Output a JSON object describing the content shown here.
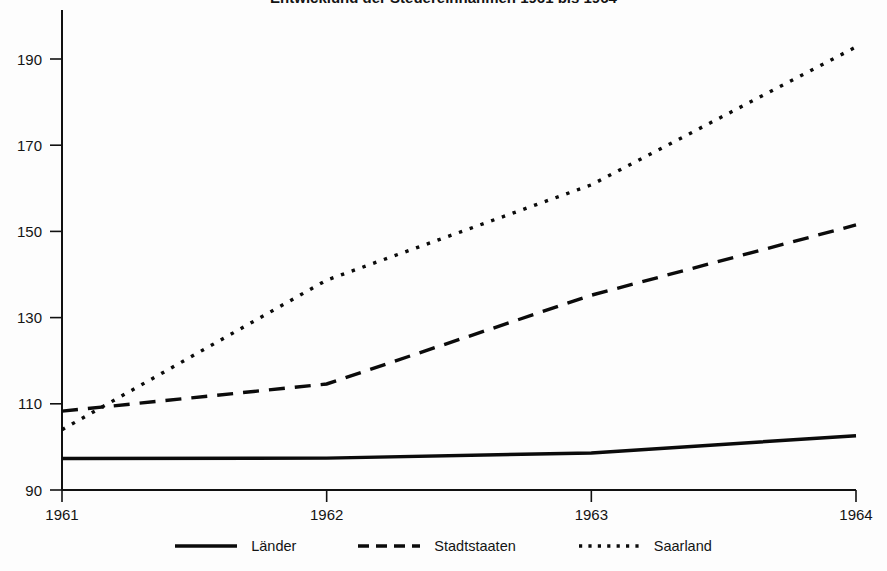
{
  "chart_data": {
    "type": "line",
    "title": "Entwicklung der Steuereinnahmen 1961 bis 1964",
    "xlabel": "",
    "ylabel": "",
    "x": [
      1961,
      1962,
      1963,
      1964
    ],
    "xticklabels": [
      "1961",
      "1962",
      "1963",
      "1964"
    ],
    "yticklabels": [
      "90",
      "110",
      "130",
      "150",
      "170",
      "190"
    ],
    "yticks": [
      90,
      110,
      130,
      150,
      170,
      190
    ],
    "xlim": [
      1961,
      1964
    ],
    "ylim": [
      90,
      197
    ],
    "grid": false,
    "legend_position": "bottom",
    "series": [
      {
        "name": "Länder",
        "style": "solid",
        "color": "#0b0b0b",
        "values": [
          97.3,
          97.4,
          98.6,
          102.6
        ]
      },
      {
        "name": "Stadtstaaten",
        "style": "dashed",
        "color": "#0b0b0b",
        "values": [
          108.3,
          114.6,
          135.2,
          151.5
        ]
      },
      {
        "name": "Saarland",
        "style": "dotted",
        "color": "#0b0b0b",
        "values": [
          104.0,
          138.7,
          160.8,
          192.8
        ]
      }
    ]
  },
  "legend": {
    "items": [
      {
        "label": "Länder",
        "swatch": "solid-line-swatch"
      },
      {
        "label": "Stadtstaaten",
        "swatch": "dashed-line-swatch"
      },
      {
        "label": "Saarland",
        "swatch": "dotted-line-swatch"
      }
    ]
  }
}
